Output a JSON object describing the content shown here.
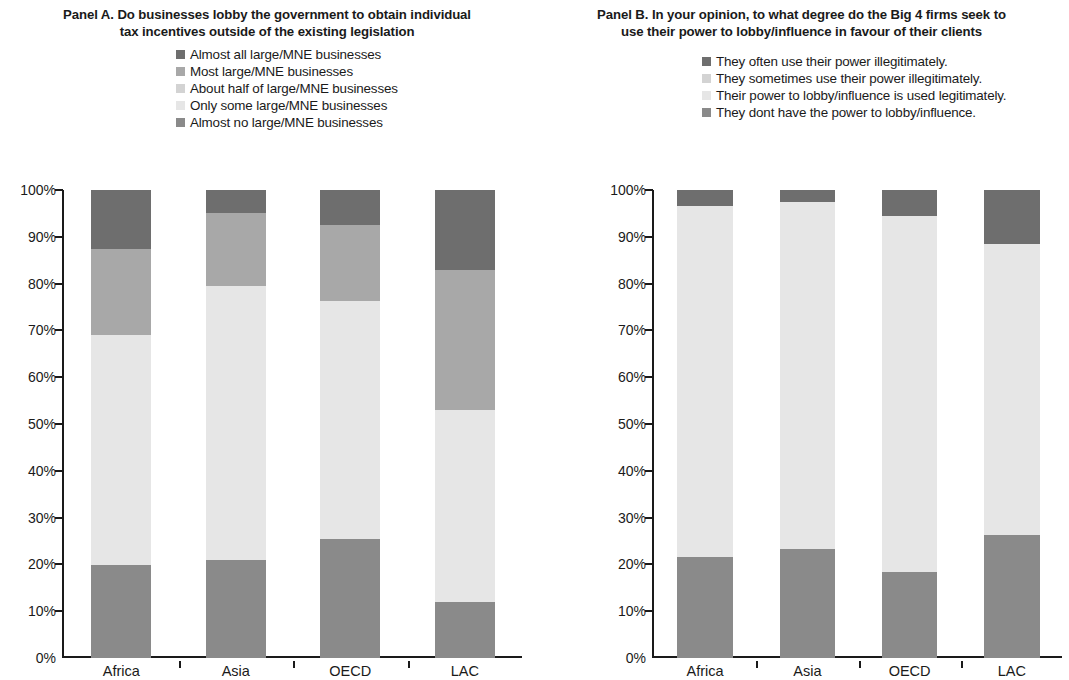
{
  "panels": [
    {
      "id": "panel-a",
      "title": "Panel A. Do businesses lobby the government to obtain individual tax incentives outside of the existing legislation",
      "legend": [
        {
          "label": "Almost all large/MNE businesses",
          "color": "#6e6e6e"
        },
        {
          "label": "Most large/MNE businesses",
          "color": "#a8a8a8"
        },
        {
          "label": "About half of large/MNE businesses",
          "color": "#d3d3d3"
        },
        {
          "label": "Only some large/MNE businesses",
          "color": "#e6e6e6"
        },
        {
          "label": "Almost no large/MNE businesses",
          "color": "#8a8a8a"
        }
      ],
      "yticks": [
        "0%",
        "10%",
        "20%",
        "30%",
        "40%",
        "50%",
        "60%",
        "70%",
        "80%",
        "90%",
        "100%"
      ],
      "categories": [
        "Africa",
        "Asia",
        "OECD",
        "LAC"
      ]
    },
    {
      "id": "panel-b",
      "title": "Panel B. In your opinion, to what degree do the Big 4 firms seek to use their power to lobby/influence in favour of their clients",
      "legend": [
        {
          "label": "They often use their power illegitimately.",
          "color": "#6e6e6e"
        },
        {
          "label": "They sometimes use their power illegitimately.",
          "color": "#d3d3d3"
        },
        {
          "label": "Their power to lobby/influence is used legitimately.",
          "color": "#e6e6e6"
        },
        {
          "label": "They dont have the power to lobby/influence.",
          "color": "#8a8a8a"
        }
      ],
      "yticks": [
        "0%",
        "10%",
        "20%",
        "30%",
        "40%",
        "50%",
        "60%",
        "70%",
        "80%",
        "90%",
        "100%"
      ],
      "categories": [
        "Africa",
        "Asia",
        "OECD",
        "LAC"
      ]
    }
  ],
  "chart_data": [
    {
      "type": "bar",
      "stacked": true,
      "normalized_100": true,
      "title": "Panel A. Do businesses lobby the government to obtain individual tax incentives outside of the existing legislation",
      "xlabel": "",
      "ylabel": "",
      "ylim": [
        0,
        100
      ],
      "ytick_values": [
        0,
        10,
        20,
        30,
        40,
        50,
        60,
        70,
        80,
        90,
        100
      ],
      "grid": false,
      "legend_position": "above-plot",
      "categories": [
        "Africa",
        "Asia",
        "OECD",
        "LAC"
      ],
      "series": [
        {
          "name": "Almost no large/MNE businesses",
          "color": "#8a8a8a",
          "values": [
            19.8,
            21.0,
            25.5,
            12.0
          ]
        },
        {
          "name": "Only some large/MNE businesses",
          "color": "#e6e6e6",
          "values": [
            49.2,
            58.5,
            50.8,
            41.0
          ]
        },
        {
          "name": "About half of large/MNE businesses",
          "color": "#d3d3d3",
          "values": [
            0.0,
            0.0,
            0.0,
            0.0
          ]
        },
        {
          "name": "Most large/MNE businesses",
          "color": "#a8a8a8",
          "values": [
            18.5,
            15.5,
            16.2,
            30.0
          ]
        },
        {
          "name": "Almost all large/MNE businesses",
          "color": "#6e6e6e",
          "values": [
            12.5,
            5.0,
            7.5,
            17.0
          ]
        }
      ]
    },
    {
      "type": "bar",
      "stacked": true,
      "normalized_100": true,
      "title": "Panel B. In your opinion, to what degree do the Big 4 firms seek to use their power to lobby/influence in favour of their clients",
      "xlabel": "",
      "ylabel": "",
      "ylim": [
        0,
        100
      ],
      "ytick_values": [
        0,
        10,
        20,
        30,
        40,
        50,
        60,
        70,
        80,
        90,
        100
      ],
      "grid": false,
      "legend_position": "above-plot",
      "categories": [
        "Africa",
        "Asia",
        "OECD",
        "LAC"
      ],
      "series": [
        {
          "name": "They dont have the power to lobby/influence.",
          "color": "#8a8a8a",
          "values": [
            21.5,
            23.2,
            18.3,
            26.2
          ]
        },
        {
          "name": "Their power to lobby/influence is used legitimately.",
          "color": "#e6e6e6",
          "values": [
            75.0,
            74.3,
            76.2,
            62.3
          ]
        },
        {
          "name": "They sometimes use their power illegitimately.",
          "color": "#d3d3d3",
          "values": [
            0.0,
            0.0,
            0.0,
            0.0
          ]
        },
        {
          "name": "They often use their power illegitimately.",
          "color": "#6e6e6e",
          "values": [
            3.5,
            2.5,
            5.5,
            11.5
          ]
        }
      ]
    }
  ]
}
